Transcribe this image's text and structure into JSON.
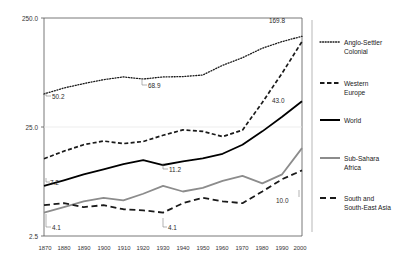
{
  "chart_data": {
    "type": "line",
    "title": "",
    "subtitle": "",
    "xlabel": "",
    "ylabel": "",
    "yscale": "log",
    "ylim": [
      2.5,
      250.0
    ],
    "xlim": [
      1870,
      2000
    ],
    "grid": "horizontal-faint",
    "legend_position": "right",
    "y_ticks": [
      "250.0",
      "25.0",
      "2.5"
    ],
    "y_tick_values": [
      250.0,
      25.0,
      2.5
    ],
    "x_ticks": [
      "1870",
      "1880",
      "1890",
      "1900",
      "1910",
      "1920",
      "1930",
      "1940",
      "1950",
      "1960",
      "1970",
      "1980",
      "1990",
      "2000"
    ],
    "x": [
      1870,
      1880,
      1890,
      1900,
      1910,
      1920,
      1930,
      1940,
      1950,
      1960,
      1970,
      1980,
      1990,
      2000
    ],
    "series": [
      {
        "name": "Anglo-Settler Colonial",
        "style": "dotted",
        "color": "#1a1a1a",
        "values": [
          50.2,
          57.0,
          62.5,
          68.0,
          72.0,
          68.9,
          72.0,
          72.5,
          75.0,
          92.0,
          108.0,
          132.0,
          152.0,
          169.8
        ]
      },
      {
        "name": "Western Europe",
        "style": "dashed",
        "color": "#1a1a1a",
        "values": [
          12.8,
          15.0,
          17.2,
          18.6,
          17.6,
          18.4,
          21.0,
          23.5,
          22.8,
          20.4,
          23.4,
          42.0,
          78.0,
          152.0
        ]
      },
      {
        "name": "World",
        "style": "solid",
        "color": "#000000",
        "values": [
          7.2,
          8.1,
          9.2,
          10.2,
          11.4,
          12.4,
          11.2,
          12.1,
          12.9,
          14.2,
          17.2,
          22.8,
          31.0,
          43.0
        ]
      },
      {
        "name": "Sub-Sahara Africa",
        "style": "solid",
        "color": "#8c8c8c",
        "values": [
          4.1,
          4.6,
          5.2,
          5.6,
          5.3,
          6.1,
          7.2,
          6.4,
          6.9,
          8.0,
          8.9,
          7.6,
          9.2,
          16.0
        ]
      },
      {
        "name": "South and South-East Asia",
        "style": "long-dashed",
        "color": "#1a1a1a",
        "values": [
          4.8,
          5.0,
          4.6,
          4.8,
          4.4,
          4.3,
          4.1,
          5.0,
          5.6,
          5.2,
          5.0,
          6.4,
          8.3,
          10.0
        ]
      }
    ],
    "annotations": [
      {
        "text": "50.2",
        "series": "Anglo-Settler Colonial",
        "x": 1870
      },
      {
        "text": "68.9",
        "series": "Anglo-Settler Colonial",
        "x": 1920
      },
      {
        "text": "169.8",
        "series": "Anglo-Settler Colonial",
        "x": 2000
      },
      {
        "text": "43.0",
        "series": "World",
        "x": 2000
      },
      {
        "text": "7.2",
        "series": "World",
        "x": 1870
      },
      {
        "text": "11.2",
        "series": "World",
        "x": 1930
      },
      {
        "text": "4.1",
        "series": "Sub-Sahara Africa",
        "x": 1870
      },
      {
        "text": "4.1",
        "series": "South and South-East Asia",
        "x": 1930
      },
      {
        "text": "10.0",
        "series": "South and South-East Asia",
        "x": 2000
      }
    ]
  },
  "legend": {
    "items": [
      {
        "label_line1": "Anglo-Settler",
        "label_line2": "Colonial"
      },
      {
        "label_line1": "Western",
        "label_line2": "Europe"
      },
      {
        "label_line1": "World",
        "label_line2": ""
      },
      {
        "label_line1": "Sub-Sahara",
        "label_line2": "Africa"
      },
      {
        "label_line1": "South and",
        "label_line2": "South-East Asia"
      }
    ]
  },
  "axes": {
    "y": {
      "t0": "250.0",
      "t1": "25.0",
      "t2": "2.5"
    },
    "x": {
      "t0": "1870",
      "t1": "1880",
      "t2": "1890",
      "t3": "1900",
      "t4": "1910",
      "t5": "1920",
      "t6": "1930",
      "t7": "1940",
      "t8": "1950",
      "t9": "1960",
      "t10": "1970",
      "t11": "1980",
      "t12": "1990",
      "t13": "2000"
    }
  },
  "labels": {
    "a50_2": "50.2",
    "a68_9": "68.9",
    "a169_8": "169.8",
    "a43_0": "43.0",
    "a7_2": "7.2",
    "a11_2": "11.2",
    "a4_1_ssa": "4.1",
    "a4_1_sea": "4.1",
    "a10_0": "10.0"
  }
}
